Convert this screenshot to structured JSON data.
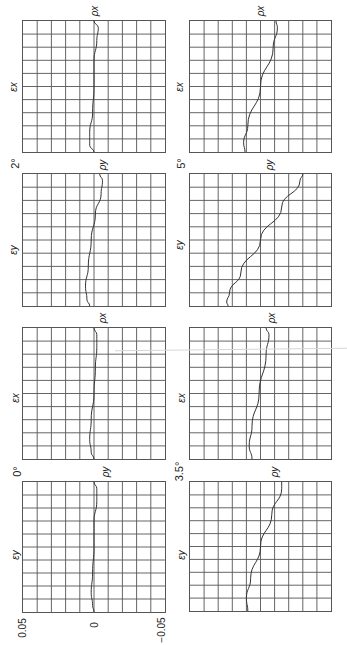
{
  "figure": {
    "orientation": "rotated-90-ccw",
    "axis_ticks": [
      "0.05",
      "0",
      "−0.05"
    ],
    "angle_labels": [
      "2°",
      "5°",
      "0°",
      "3.5°"
    ]
  },
  "chart_data": {
    "type": "line",
    "title": "",
    "xlabel": "",
    "ylabel": "",
    "value_range": [
      0.05,
      -0.05
    ],
    "grid": {
      "on": true,
      "divisions": [
        10,
        10
      ]
    },
    "tick_labels": [
      "0.05",
      "0",
      "-0.05"
    ],
    "panels": [
      {
        "id": "2deg-x",
        "angle": "2°",
        "strain_label": "εx",
        "end_label": "ρx",
        "col": 0,
        "row": 0,
        "points": [
          [
            0,
            0.0
          ],
          [
            0.05,
            -0.003
          ],
          [
            0.15,
            -0.002
          ],
          [
            0.3,
            0.0
          ],
          [
            0.5,
            0.0
          ],
          [
            0.7,
            0.001
          ],
          [
            0.85,
            0.003
          ],
          [
            0.95,
            0.003
          ],
          [
            1,
            0.0
          ]
        ]
      },
      {
        "id": "2deg-y",
        "angle": "2°",
        "strain_label": "εy",
        "end_label": "ρy",
        "col": 0,
        "row": 1,
        "points": [
          [
            0,
            -0.004
          ],
          [
            0.05,
            -0.006
          ],
          [
            0.15,
            -0.005
          ],
          [
            0.3,
            -0.001
          ],
          [
            0.5,
            0.002
          ],
          [
            0.7,
            0.004
          ],
          [
            0.85,
            0.006
          ],
          [
            0.95,
            0.005
          ],
          [
            1,
            0.003
          ]
        ]
      },
      {
        "id": "5deg-x",
        "angle": "5°",
        "strain_label": "εx",
        "end_label": "ρx",
        "col": 1,
        "row": 0,
        "points": [
          [
            0,
            -0.011
          ],
          [
            0.05,
            -0.012
          ],
          [
            0.2,
            -0.009
          ],
          [
            0.5,
            0.0
          ],
          [
            0.8,
            0.009
          ],
          [
            0.93,
            0.012
          ],
          [
            1,
            0.011
          ]
        ]
      },
      {
        "id": "5deg-y",
        "angle": "5°",
        "strain_label": "εy",
        "end_label": "ρy",
        "col": 1,
        "row": 1,
        "points": [
          [
            0,
            -0.03
          ],
          [
            0.05,
            -0.028
          ],
          [
            0.25,
            -0.015
          ],
          [
            0.5,
            0.0
          ],
          [
            0.75,
            0.014
          ],
          [
            0.9,
            0.022
          ],
          [
            0.97,
            0.024
          ],
          [
            1,
            0.023
          ]
        ]
      },
      {
        "id": "0deg-x",
        "angle": "0°",
        "strain_label": "εx",
        "end_label": "ρx",
        "col": 0,
        "row": 2,
        "points": [
          [
            0,
            0.0
          ],
          [
            0.05,
            -0.002
          ],
          [
            0.15,
            -0.002
          ],
          [
            0.3,
            -0.001
          ],
          [
            0.5,
            0.0
          ],
          [
            0.7,
            0.002
          ],
          [
            0.85,
            0.003
          ],
          [
            0.95,
            0.002
          ],
          [
            1,
            0.0
          ]
        ]
      },
      {
        "id": "0deg-y",
        "angle": "0°",
        "strain_label": "εy",
        "end_label": "ρy",
        "col": 0,
        "row": 3,
        "points": [
          [
            0,
            0.0
          ],
          [
            0.05,
            -0.002
          ],
          [
            0.15,
            -0.002
          ],
          [
            0.3,
            0.0
          ],
          [
            0.5,
            0.0
          ],
          [
            0.7,
            0.001
          ],
          [
            0.85,
            0.002
          ],
          [
            0.95,
            0.001
          ],
          [
            1,
            0.0
          ]
        ]
      },
      {
        "id": "3.5deg-x",
        "angle": "3.5°",
        "strain_label": "εx",
        "end_label": "ρx",
        "col": 1,
        "row": 2,
        "points": [
          [
            0,
            -0.004
          ],
          [
            0.05,
            -0.006
          ],
          [
            0.2,
            -0.004
          ],
          [
            0.5,
            0.001
          ],
          [
            0.75,
            0.006
          ],
          [
            0.9,
            0.008
          ],
          [
            1,
            0.006
          ]
        ]
      },
      {
        "id": "3.5deg-y",
        "angle": "3.5°",
        "strain_label": "εy",
        "end_label": "ρy",
        "col": 1,
        "row": 3,
        "points": [
          [
            0,
            -0.015
          ],
          [
            0.05,
            -0.015
          ],
          [
            0.25,
            -0.008
          ],
          [
            0.5,
            0.0
          ],
          [
            0.75,
            0.007
          ],
          [
            0.9,
            0.01
          ],
          [
            1,
            0.009
          ]
        ]
      }
    ]
  }
}
